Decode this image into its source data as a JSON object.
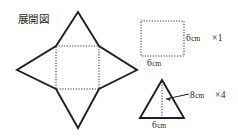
{
  "figure": {
    "net_title": "展開図",
    "net": {
      "name": "square-pyramid-net",
      "inner_square": {
        "x": 56,
        "y": 46,
        "size": 43
      },
      "apexes": {
        "top": {
          "x": 78,
          "y": 12
        },
        "right": {
          "x": 137,
          "y": 70
        },
        "bottom": {
          "x": 78,
          "y": 128
        },
        "left": {
          "x": 17,
          "y": 70
        }
      }
    },
    "parts": [
      {
        "shape": "square",
        "side_label": "6",
        "base_label": "6",
        "unit": "cm",
        "count_label": "×1"
      },
      {
        "shape": "triangle",
        "height_label": "8",
        "base_label": "6",
        "unit": "cm",
        "count_label": "×4"
      }
    ]
  },
  "colors": {
    "ink": "#231f20",
    "dotted": "#3a3637",
    "background": "#ffffff"
  }
}
